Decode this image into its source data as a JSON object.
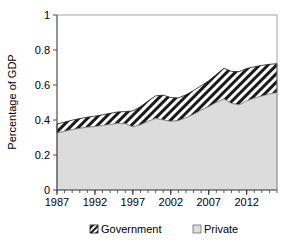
{
  "chart_data": {
    "type": "area",
    "stacked": true,
    "title": "",
    "xlabel": "",
    "ylabel": "Percentage of GDP",
    "xlim": [
      1987,
      2016
    ],
    "ylim": [
      0,
      1
    ],
    "ytick_labels": [
      "0",
      "0.2",
      "0.4",
      "0.6",
      "0.8",
      "1"
    ],
    "ytick_values": [
      0,
      0.2,
      0.4,
      0.6,
      0.8,
      1
    ],
    "xtick_labels": [
      "1987",
      "1992",
      "1997",
      "2002",
      "2007",
      "2012"
    ],
    "xtick_values": [
      1987,
      1992,
      1997,
      2002,
      2007,
      2012
    ],
    "minor_xtick_interval": 1,
    "grid": false,
    "legend_position": "bottom",
    "x": [
      1987,
      1988,
      1989,
      1990,
      1991,
      1992,
      1993,
      1994,
      1995,
      1996,
      1997,
      1998,
      1999,
      2000,
      2001,
      2002,
      2003,
      2004,
      2005,
      2006,
      2007,
      2008,
      2009,
      2010,
      2011,
      2012,
      2013,
      2014,
      2015,
      2016
    ],
    "series": [
      {
        "name": "Private",
        "fill": "#dcdcdc",
        "pattern": "solid-light-gray",
        "values": [
          0.325,
          0.335,
          0.345,
          0.352,
          0.358,
          0.362,
          0.368,
          0.374,
          0.38,
          0.378,
          0.36,
          0.372,
          0.392,
          0.408,
          0.4,
          0.392,
          0.396,
          0.412,
          0.432,
          0.456,
          0.476,
          0.5,
          0.52,
          0.494,
          0.486,
          0.508,
          0.524,
          0.536,
          0.548,
          0.556
        ]
      },
      {
        "name": "Government",
        "fill": "#ffffff",
        "pattern": "black-diagonal-hatch",
        "values": [
          0.052,
          0.053,
          0.054,
          0.056,
          0.058,
          0.06,
          0.062,
          0.064,
          0.066,
          0.07,
          0.092,
          0.104,
          0.116,
          0.13,
          0.142,
          0.136,
          0.13,
          0.132,
          0.136,
          0.14,
          0.148,
          0.16,
          0.176,
          0.184,
          0.19,
          0.186,
          0.18,
          0.176,
          0.17,
          0.166
        ]
      }
    ],
    "totals": [
      0.377,
      0.388,
      0.399,
      0.408,
      0.416,
      0.422,
      0.43,
      0.438,
      0.446,
      0.448,
      0.452,
      0.476,
      0.508,
      0.538,
      0.542,
      0.528,
      0.526,
      0.544,
      0.568,
      0.596,
      0.624,
      0.66,
      0.696,
      0.678,
      0.676,
      0.694,
      0.704,
      0.712,
      0.718,
      0.722
    ]
  },
  "legend": {
    "items": [
      {
        "label": "Government",
        "swatch": "hatch"
      },
      {
        "label": "Private",
        "swatch": "gray"
      }
    ]
  }
}
